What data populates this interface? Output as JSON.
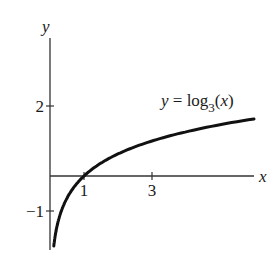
{
  "chart_data": {
    "type": "line",
    "title": "",
    "function_label": "y = log_3(x)",
    "function_label_parts": {
      "lhs": "y",
      "eq": " = log",
      "base": "3",
      "arg_open": "(",
      "arg": "x",
      "arg_close": ")"
    },
    "xlabel": "x",
    "ylabel": "y",
    "x_ticks": [
      {
        "value": 1,
        "label": "1"
      },
      {
        "value": 3,
        "label": "3"
      }
    ],
    "y_ticks": [
      {
        "value": 2,
        "label": "2"
      },
      {
        "value": -1,
        "label": "−1"
      }
    ],
    "xlim": [
      0,
      6
    ],
    "ylim": [
      -2,
      4
    ],
    "grid": false,
    "legend": "none",
    "series": [
      {
        "name": "y = log3(x)",
        "x": [
          0.111,
          0.2,
          0.333,
          0.5,
          1,
          1.5,
          2,
          3,
          4,
          5,
          6
        ],
        "values": [
          -2.0,
          -1.465,
          -1.0,
          -0.631,
          0,
          0.369,
          0.631,
          1.0,
          1.262,
          1.465,
          1.631
        ]
      }
    ]
  },
  "plot": {
    "origin_px": [
      50,
      176
    ],
    "px_per_unit_x": 34,
    "px_per_unit_y": 35,
    "curve_color": "#111111",
    "axis_color": "#333333"
  }
}
